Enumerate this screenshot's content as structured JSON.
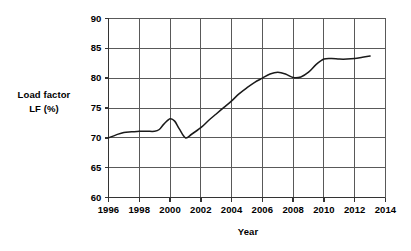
{
  "chart_data": {
    "type": "line",
    "title": "",
    "subtitle": "",
    "xlabel": "Year",
    "ylabel_line1": "Load factor",
    "ylabel_line2": "LF (%)",
    "ylabel": "Load factor LF (%)",
    "xlim": [
      1996,
      2014
    ],
    "ylim": [
      60,
      90
    ],
    "xticks": [
      1996,
      1998,
      2000,
      2002,
      2004,
      2006,
      2008,
      2010,
      2012,
      2014
    ],
    "yticks": [
      60,
      65,
      70,
      75,
      80,
      85,
      90
    ],
    "xtick_labels": [
      "1996",
      "1998",
      "2000",
      "2002",
      "2004",
      "2006",
      "2008",
      "2010",
      "2012",
      "2014"
    ],
    "ytick_labels": [
      "60",
      "65",
      "70",
      "75",
      "80",
      "85",
      "90"
    ],
    "grid": true,
    "grid_color": "#595959",
    "legend": false,
    "legend_position": "none",
    "line_color": "#1a1a1a",
    "background_color": "#ffffff",
    "series": [
      {
        "name": "Load factor LF (%)",
        "x": [
          1996,
          1996.5,
          1997,
          1997.5,
          1998,
          1998.5,
          1999,
          1999.3,
          1999.6,
          2000,
          2000.3,
          2000.6,
          2001,
          2001.4,
          2002,
          2002.5,
          2003,
          2003.5,
          2004,
          2004.5,
          2005,
          2005.5,
          2006,
          2006.5,
          2007,
          2007.5,
          2008,
          2008.5,
          2009,
          2009.5,
          2010,
          2010.5,
          2011,
          2011.5,
          2012,
          2012.5,
          2013
        ],
        "y": [
          70.0,
          70.5,
          70.9,
          71.0,
          71.1,
          71.1,
          71.1,
          71.4,
          72.3,
          73.2,
          72.8,
          71.5,
          70.0,
          70.6,
          71.7,
          72.9,
          74.0,
          75.1,
          76.2,
          77.4,
          78.4,
          79.3,
          80.0,
          80.7,
          81.0,
          80.7,
          80.1,
          80.2,
          81.0,
          82.3,
          83.2,
          83.3,
          83.2,
          83.2,
          83.3,
          83.5,
          83.7
        ]
      }
    ],
    "annotations": []
  },
  "axis_titles": {
    "y_line1": "Load factor",
    "y_line2": "LF (%)",
    "x": "Year"
  }
}
